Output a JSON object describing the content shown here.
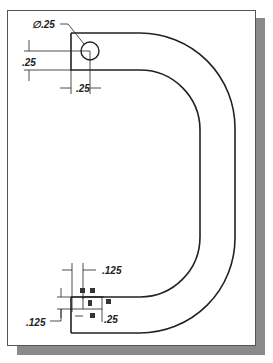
{
  "drawing": {
    "title": "Hook part drawing",
    "dimensions": {
      "hole_diameter": "∅.25",
      "hole_vertical_offset": ".25",
      "hole_horizontal_offset": ".25",
      "end_notch_horizontal": ".125",
      "end_notch_vertical": ".125",
      "end_width": ".25"
    },
    "colors": {
      "line": "#222222",
      "shadow": "#8a8a8a",
      "page": "#ffffff"
    }
  }
}
